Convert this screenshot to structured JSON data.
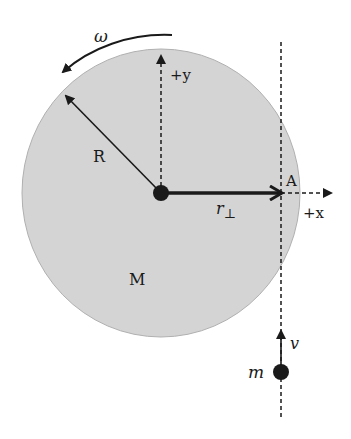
{
  "diagram": {
    "type": "rotational-collision",
    "disk": {
      "label": "M",
      "radius_label": "R",
      "fill": "#d4d4d4",
      "edge": "#a8a8a8"
    },
    "angular_velocity": {
      "label": "ω"
    },
    "axes": {
      "x_label": "+x",
      "y_label": "+y"
    },
    "point": {
      "label": "A"
    },
    "lever_arm": {
      "label": "r",
      "subscript": "⊥"
    },
    "particle": {
      "label": "m",
      "velocity_label": "v"
    },
    "colors": {
      "ink": "#1a1a1a",
      "disk": "#d4d4d4"
    }
  }
}
